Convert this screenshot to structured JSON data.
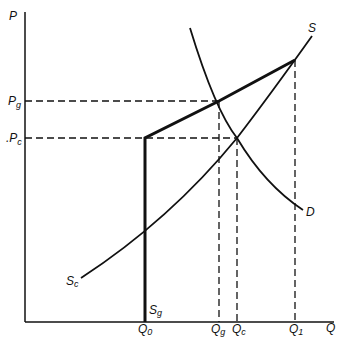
{
  "diagram": {
    "type": "supply-demand-price-discrimination",
    "axes": {
      "y_label": "P",
      "x_label": "Q"
    },
    "price_levels": [
      {
        "id": "Pg",
        "main": "P",
        "sub": "g"
      },
      {
        "id": "Pc",
        "main": "P",
        "sub": "c",
        "prefix": "."
      }
    ],
    "quantity_levels": [
      {
        "id": "Q0",
        "main": "Q",
        "sub": "0"
      },
      {
        "id": "Qg",
        "main": "Q",
        "sub": "g"
      },
      {
        "id": "Qc",
        "main": "Q",
        "sub": "c"
      },
      {
        "id": "Q1",
        "main": "Q",
        "sub": "1"
      }
    ],
    "curves": {
      "S": {
        "label": "S"
      },
      "D": {
        "label": "D"
      },
      "Sc": {
        "main": "S",
        "sub": "c"
      },
      "Sg": {
        "main": "S",
        "sub": "g"
      }
    },
    "colors": {
      "line": "#111111",
      "background": "#ffffff"
    }
  }
}
